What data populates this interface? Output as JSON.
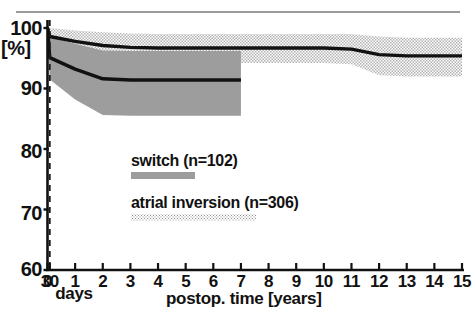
{
  "chart_data": {
    "type": "line",
    "title": "",
    "subtitle": "",
    "xlabel": "postop. time [years]",
    "ylabel": "[%]",
    "xlabel_secondary": "days",
    "grid": false,
    "legend_position": "inside-center",
    "ylim": [
      60,
      100
    ],
    "xlim": [
      0,
      15
    ],
    "yticks": [
      100,
      90,
      80,
      70,
      60
    ],
    "ytick_labels": [
      "100",
      "90",
      "80",
      "70",
      "60"
    ],
    "xticks": [
      0,
      0.0822,
      1,
      2,
      3,
      4,
      5,
      6,
      7,
      8,
      9,
      10,
      11,
      12,
      13,
      14,
      15
    ],
    "xtick_labels": [
      "0",
      "30",
      "1",
      "2",
      "3",
      "4",
      "5",
      "6",
      "7",
      "8",
      "9",
      "10",
      "11",
      "12",
      "13",
      "14",
      "15"
    ],
    "annotations": [
      {
        "name": "30-day-marker",
        "type": "vline",
        "x": 0.0822,
        "style": "dashed",
        "color": "#1a1a1a"
      }
    ],
    "series": [
      {
        "name": "switch (n=102)",
        "key": "switch",
        "n": 102,
        "band_style": "solid-gray",
        "band_color": "#9d9d9d",
        "line_color": "#111111",
        "x": [
          0,
          0.0822,
          1,
          2,
          3,
          4,
          5,
          6,
          7
        ],
        "values": [
          100,
          95.1,
          93.2,
          91.6,
          91.4,
          91.4,
          91.4,
          91.4,
          91.4
        ],
        "ci_upper": [
          100,
          98.5,
          97.4,
          96.3,
          96.2,
          96.2,
          96.2,
          96.2,
          96.2
        ],
        "ci_lower": [
          100,
          91.5,
          88.2,
          85.6,
          85.5,
          85.5,
          85.5,
          85.5,
          85.5
        ]
      },
      {
        "name": "atrial inversion (n=306)",
        "key": "atrial_inversion",
        "n": 306,
        "band_style": "dotted-gray",
        "band_color": "#c9c9c9",
        "line_color": "#111111",
        "x": [
          0,
          0.0822,
          1,
          2,
          3,
          4,
          5,
          6,
          7,
          8,
          9,
          10,
          11,
          12,
          13,
          14,
          15
        ],
        "values": [
          100,
          98.6,
          97.8,
          97.1,
          96.8,
          96.7,
          96.7,
          96.7,
          96.7,
          96.7,
          96.7,
          96.7,
          96.5,
          95.6,
          95.4,
          95.4,
          95.4
        ],
        "ci_upper": [
          100,
          100,
          99.6,
          99.3,
          99.1,
          99.0,
          99.0,
          99.0,
          99.0,
          99.0,
          99.0,
          99.0,
          99.0,
          98.6,
          98.4,
          98.4,
          98.4
        ],
        "ci_lower": [
          100,
          97.1,
          95.9,
          94.8,
          94.3,
          94.2,
          94.2,
          94.2,
          94.2,
          94.2,
          94.2,
          94.2,
          94.0,
          92.2,
          92.0,
          92.0,
          92.0
        ]
      }
    ]
  },
  "legend": {
    "entries": [
      {
        "label": "switch (n=102)",
        "swatch": "solid-gray"
      },
      {
        "label": "atrial inversion (n=306)",
        "swatch": "dotted-gray"
      }
    ]
  },
  "axes": {
    "y_unit_label": "[%]",
    "x_title": "postop. time [years]",
    "x_days_label": "days"
  },
  "colors": {
    "axis": "#111111",
    "curve": "#111111",
    "switch_band": "#9d9d9d",
    "inversion_band": "#c9c9c9",
    "background": "#ffffff",
    "top_rule": "#9a9a9a"
  }
}
